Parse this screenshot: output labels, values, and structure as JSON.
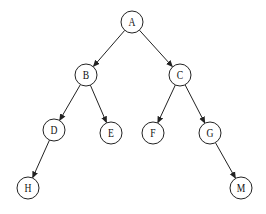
{
  "diagram": {
    "type": "binary-tree",
    "node_radius": 11,
    "colors": {
      "stroke": "#222222",
      "fill": "#ffffff",
      "text": "#111111"
    },
    "nodes": [
      {
        "id": "A",
        "label": "A",
        "x": 132,
        "y": 22
      },
      {
        "id": "B",
        "label": "B",
        "x": 86,
        "y": 75
      },
      {
        "id": "C",
        "label": "C",
        "x": 180,
        "y": 75
      },
      {
        "id": "D",
        "label": "D",
        "x": 54,
        "y": 130
      },
      {
        "id": "E",
        "label": "E",
        "x": 111,
        "y": 133
      },
      {
        "id": "F",
        "label": "F",
        "x": 153,
        "y": 133
      },
      {
        "id": "G",
        "label": "G",
        "x": 210,
        "y": 133
      },
      {
        "id": "H",
        "label": "H",
        "x": 28,
        "y": 188
      },
      {
        "id": "M",
        "label": "M",
        "x": 241,
        "y": 188
      }
    ],
    "edges": [
      {
        "from": "A",
        "to": "B"
      },
      {
        "from": "A",
        "to": "C"
      },
      {
        "from": "B",
        "to": "D"
      },
      {
        "from": "B",
        "to": "E"
      },
      {
        "from": "C",
        "to": "F"
      },
      {
        "from": "C",
        "to": "G"
      },
      {
        "from": "D",
        "to": "H"
      },
      {
        "from": "G",
        "to": "M"
      }
    ]
  }
}
